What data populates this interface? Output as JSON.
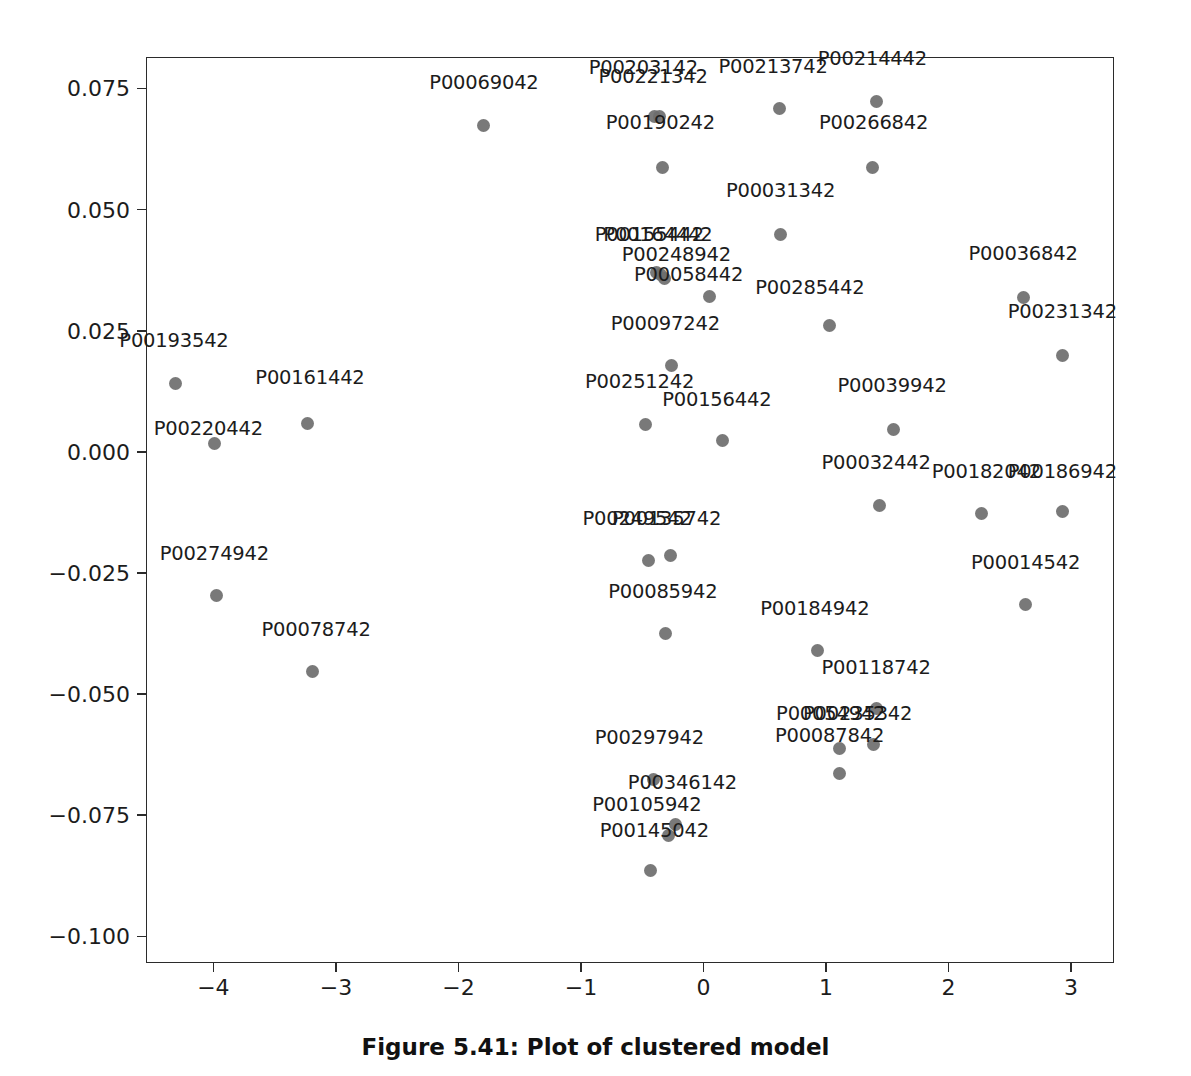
{
  "caption": "Figure 5.41: Plot of clustered model",
  "chart_data": {
    "type": "scatter",
    "title": "",
    "xlabel": "",
    "ylabel": "",
    "xlim": [
      -4.55,
      3.35
    ],
    "ylim": [
      -0.1055,
      0.0815
    ],
    "grid": false,
    "legend": null,
    "marker_color": "#6e6e6e",
    "marker_size": 13,
    "label_color": "#1c1c1c",
    "axis_color": "#2b2b2b",
    "xticks": [
      -4,
      -3,
      -2,
      -1,
      0,
      1,
      2,
      3
    ],
    "xtick_labels": [
      "−4",
      "−3",
      "−2",
      "−1",
      "0",
      "1",
      "2",
      "3"
    ],
    "yticks": [
      0.075,
      0.05,
      0.025,
      0.0,
      -0.025,
      -0.05,
      -0.075,
      -0.1
    ],
    "ytick_labels": [
      "0.075",
      "0.050",
      "0.025",
      "0.000",
      "−0.025",
      "−0.050",
      "−0.075",
      "−0.100"
    ],
    "points": [
      {
        "label": "P00069042",
        "x": -1.8,
        "y": 0.0675,
        "lx": -1.8,
        "ly": 0.0745
      },
      {
        "label": "P00203142",
        "x": -0.41,
        "y": 0.0695,
        "lx": -0.5,
        "ly": 0.0775
      },
      {
        "label": "P00221342",
        "x": -0.37,
        "y": 0.0695,
        "lx": -0.42,
        "ly": 0.0758
      },
      {
        "label": "P00213742",
        "x": 0.61,
        "y": 0.071,
        "lx": 0.56,
        "ly": 0.0778
      },
      {
        "label": "P00214442",
        "x": 1.4,
        "y": 0.0725,
        "lx": 1.37,
        "ly": 0.0795
      },
      {
        "label": "P00190242",
        "x": -0.34,
        "y": 0.059,
        "lx": -0.36,
        "ly": 0.0663
      },
      {
        "label": "P00266842",
        "x": 1.37,
        "y": 0.059,
        "lx": 1.38,
        "ly": 0.0663
      },
      {
        "label": "P00031342",
        "x": 0.62,
        "y": 0.045,
        "lx": 0.62,
        "ly": 0.0522
      },
      {
        "label": "P00155442",
        "x": -0.39,
        "y": 0.0372,
        "lx": -0.45,
        "ly": 0.0432
      },
      {
        "label": "P00164442",
        "x": -0.36,
        "y": 0.0368,
        "lx": -0.38,
        "ly": 0.0432
      },
      {
        "label": "P00036842",
        "x": 2.6,
        "y": 0.032,
        "lx": 2.6,
        "ly": 0.0392
      },
      {
        "label": "P00248942",
        "x": -0.33,
        "y": 0.036,
        "lx": -0.23,
        "ly": 0.039
      },
      {
        "label": "P00058442",
        "x": 0.04,
        "y": 0.0322,
        "lx": -0.13,
        "ly": 0.0348
      },
      {
        "label": "P00285442",
        "x": 1.02,
        "y": 0.0262,
        "lx": 0.86,
        "ly": 0.0322
      },
      {
        "label": "P00231342",
        "x": 2.92,
        "y": 0.02,
        "lx": 2.92,
        "ly": 0.0272
      },
      {
        "label": "P00097242",
        "x": -0.27,
        "y": 0.018,
        "lx": -0.32,
        "ly": 0.0248
      },
      {
        "label": "P00193542",
        "x": -4.32,
        "y": 0.0143,
        "lx": -4.33,
        "ly": 0.0212
      },
      {
        "label": "P00161442",
        "x": -3.24,
        "y": 0.006,
        "lx": -3.22,
        "ly": 0.0135
      },
      {
        "label": "P00251242",
        "x": -0.48,
        "y": 0.0058,
        "lx": -0.53,
        "ly": 0.0128
      },
      {
        "label": "P00039942",
        "x": 1.54,
        "y": 0.0048,
        "lx": 1.53,
        "ly": 0.012
      },
      {
        "label": "P00220442",
        "x": -4.0,
        "y": 0.002,
        "lx": -4.05,
        "ly": 0.003
      },
      {
        "label": "P00156442",
        "x": 0.15,
        "y": 0.0025,
        "lx": 0.1,
        "ly": 0.009
      },
      {
        "label": "P00032442",
        "x": 1.43,
        "y": -0.0108,
        "lx": 1.4,
        "ly": -0.004
      },
      {
        "label": "P00182042",
        "x": 2.26,
        "y": -0.0125,
        "lx": 2.3,
        "ly": -0.0058
      },
      {
        "label": "P00186942",
        "x": 2.92,
        "y": -0.0122,
        "lx": 2.92,
        "ly": -0.0058
      },
      {
        "label": "P00249542",
        "x": -0.46,
        "y": -0.0222,
        "lx": -0.55,
        "ly": -0.0155
      },
      {
        "label": "P00135742",
        "x": -0.28,
        "y": -0.0212,
        "lx": -0.31,
        "ly": -0.0155
      },
      {
        "label": "P00274942",
        "x": -3.98,
        "y": -0.0295,
        "lx": -4.0,
        "ly": -0.0228
      },
      {
        "label": "P00014542",
        "x": 2.62,
        "y": -0.0312,
        "lx": 2.62,
        "ly": -0.0245
      },
      {
        "label": "P00085942",
        "x": -0.32,
        "y": -0.0372,
        "lx": -0.34,
        "ly": -0.0305
      },
      {
        "label": "P00184942",
        "x": 0.92,
        "y": -0.0408,
        "lx": 0.9,
        "ly": -0.034
      },
      {
        "label": "P00078742",
        "x": -3.2,
        "y": -0.0452,
        "lx": -3.17,
        "ly": -0.0385
      },
      {
        "label": "P00118742",
        "x": 1.4,
        "y": -0.0528,
        "lx": 1.4,
        "ly": -0.0462
      },
      {
        "label": "P00054942",
        "x": 1.1,
        "y": -0.061,
        "lx": 1.03,
        "ly": -0.0558
      },
      {
        "label": "P00235342",
        "x": 1.38,
        "y": -0.0602,
        "lx": 1.25,
        "ly": -0.0558
      },
      {
        "label": "P00087842",
        "x": 1.1,
        "y": -0.0662,
        "lx": 1.02,
        "ly": -0.0602
      },
      {
        "label": "P00297942",
        "x": -0.42,
        "y": -0.0675,
        "lx": -0.45,
        "ly": -0.0608
      },
      {
        "label": "P00346142",
        "x": -0.24,
        "y": -0.0768,
        "lx": -0.18,
        "ly": -0.07
      },
      {
        "label": "P00105942",
        "x": -0.29,
        "y": -0.079,
        "lx": -0.47,
        "ly": -0.0745
      },
      {
        "label": "P00145042",
        "x": -0.44,
        "y": -0.0862,
        "lx": -0.41,
        "ly": -0.08
      }
    ]
  }
}
